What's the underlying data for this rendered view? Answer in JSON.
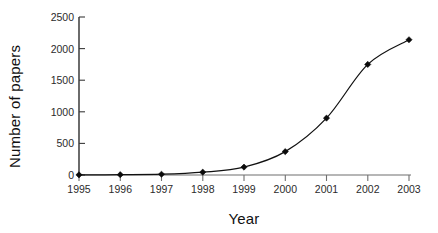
{
  "chart_data": {
    "type": "line",
    "title": "",
    "subtitle": "",
    "xlabel": "Year",
    "ylabel": "Number of papers",
    "categories": [
      "1995",
      "1996",
      "1997",
      "1998",
      "1999",
      "2000",
      "2001",
      "2002",
      "2003"
    ],
    "x": [
      1995,
      1996,
      1997,
      1998,
      1999,
      2000,
      2001,
      2002,
      2003
    ],
    "values": [
      2,
      5,
      12,
      45,
      125,
      370,
      900,
      1750,
      2140
    ],
    "series": [
      {
        "name": "Number of papers",
        "values": [
          2,
          5,
          12,
          45,
          125,
          370,
          900,
          1750,
          2140
        ]
      }
    ],
    "xlim": [
      1995,
      2003
    ],
    "ylim": [
      0,
      2500
    ],
    "ytick_labels": [
      "0",
      "500",
      "1000",
      "1500",
      "2000",
      "2500"
    ],
    "yticks": [
      0,
      500,
      1000,
      1500,
      2000,
      2500
    ],
    "xtick_labels": [
      "1995",
      "1996",
      "1997",
      "1998",
      "1999",
      "2000",
      "2001",
      "2002",
      "2003"
    ],
    "grid": false,
    "legend": false,
    "legend_position": "none",
    "marker": "diamond",
    "line_color": "#111111",
    "marker_color": "#0b0b0b",
    "background_color": "#ffffff",
    "annotations": []
  },
  "axes": {
    "y_title": "Number of papers",
    "x_title": "Year",
    "y_ticks": [
      {
        "label": "2500",
        "value": 2500
      },
      {
        "label": "2000",
        "value": 2000
      },
      {
        "label": "1500",
        "value": 1500
      },
      {
        "label": "1000",
        "value": 1000
      },
      {
        "label": "500",
        "value": 500
      },
      {
        "label": "0",
        "value": 0
      }
    ],
    "x_ticks": [
      {
        "label": "1995",
        "value": 1995
      },
      {
        "label": "1996",
        "value": 1996
      },
      {
        "label": "1997",
        "value": 1997
      },
      {
        "label": "1998",
        "value": 1998
      },
      {
        "label": "1999",
        "value": 1999
      },
      {
        "label": "2000",
        "value": 2000
      },
      {
        "label": "2001",
        "value": 2001
      },
      {
        "label": "2002",
        "value": 2002
      },
      {
        "label": "2003",
        "value": 2003
      }
    ]
  }
}
